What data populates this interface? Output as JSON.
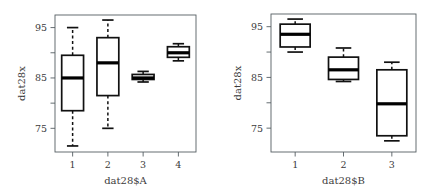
{
  "figure": {
    "background": "#ffffff",
    "line_color": "#111111",
    "axis_color": "#555e62",
    "width": 438,
    "height": 194
  },
  "chart_data": [
    {
      "type": "box",
      "panel_id": "panel-a",
      "title": "",
      "xlabel": "dat28$A",
      "ylabel": "dat28x",
      "categories": [
        "1",
        "2",
        "3",
        "4"
      ],
      "ytick_labels": [
        "75",
        "85",
        "95"
      ],
      "ytick_values": [
        75,
        85,
        95
      ],
      "yminor_values": [
        80,
        90
      ],
      "ylim": [
        70.3,
        97.5
      ],
      "grid": false,
      "legend": "none",
      "boxes": [
        {
          "category": "1",
          "whisker_low": 71.5,
          "q1": 78.5,
          "median": 85.0,
          "q3": 89.5,
          "whisker_high": 95.0
        },
        {
          "category": "2",
          "whisker_low": 75.0,
          "q1": 81.5,
          "median": 88.0,
          "q3": 93.0,
          "whisker_high": 96.5
        },
        {
          "category": "3",
          "whisker_low": 84.2,
          "q1": 84.7,
          "median": 85.0,
          "q3": 85.7,
          "whisker_high": 86.3
        },
        {
          "category": "4",
          "whisker_low": 88.4,
          "q1": 89.1,
          "median": 90.0,
          "q3": 91.2,
          "whisker_high": 91.8
        }
      ]
    },
    {
      "type": "box",
      "panel_id": "panel-b",
      "title": "",
      "xlabel": "dat28$B",
      "ylabel": "dat28x",
      "categories": [
        "1",
        "2",
        "3"
      ],
      "ytick_labels": [
        "75",
        "85",
        "95"
      ],
      "ytick_values": [
        75,
        85,
        95
      ],
      "yminor_values": [
        80,
        90
      ],
      "ylim": [
        70.3,
        97.5
      ],
      "grid": false,
      "legend": "none",
      "boxes": [
        {
          "category": "1",
          "whisker_low": 90.0,
          "q1": 91.0,
          "median": 93.5,
          "q3": 95.5,
          "whisker_high": 96.5
        },
        {
          "category": "2",
          "whisker_low": 84.2,
          "q1": 84.6,
          "median": 86.5,
          "q3": 89.0,
          "whisker_high": 90.8
        },
        {
          "category": "3",
          "whisker_low": 72.5,
          "q1": 73.5,
          "median": 79.8,
          "q3": 86.5,
          "whisker_high": 88.0
        }
      ]
    }
  ]
}
